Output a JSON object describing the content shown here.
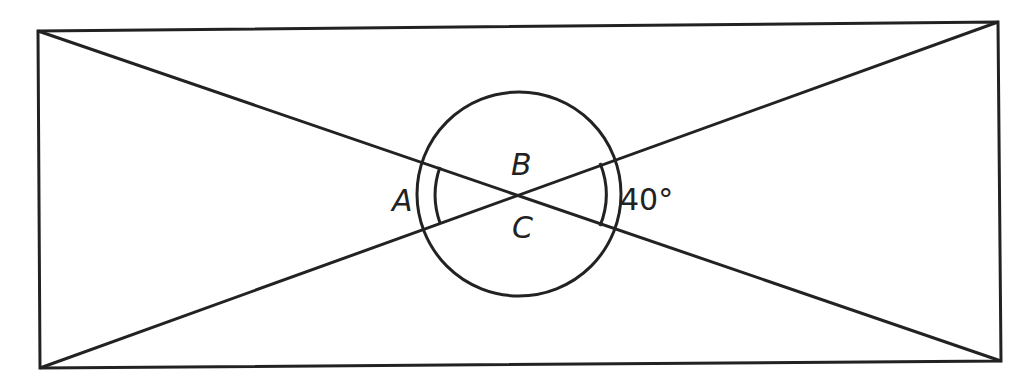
{
  "diagram": {
    "type": "geometry",
    "stroke_color": "#222222",
    "labels": {
      "A": "A",
      "B": "B",
      "C": "C",
      "given_angle": "40°"
    },
    "rectangle": {
      "corners": {
        "top_left": [
          38,
          31
        ],
        "top_right": [
          998,
          22
        ],
        "bottom_right": [
          1001,
          361
        ],
        "bottom_left": [
          40,
          368
        ]
      }
    },
    "intersection": [
      519,
      194
    ],
    "circle_radius": 102,
    "angle_arc_radius": 84
  }
}
